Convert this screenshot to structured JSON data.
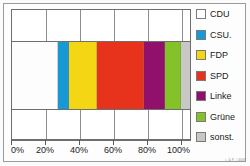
{
  "chart_data": {
    "type": "bar",
    "orientation": "horizontal-stacked",
    "title": "",
    "xlabel": "",
    "ylabel": "",
    "xlim": [
      0,
      100
    ],
    "grid": true,
    "legend_position": "right",
    "categories": [
      ""
    ],
    "tick_labels": [
      "0%",
      "20%",
      "40%",
      "60%",
      "80%",
      "100%"
    ],
    "tick_values": [
      0,
      20,
      40,
      60,
      80,
      100
    ],
    "series": [
      {
        "name": "CDU",
        "color": "#fdfdfd",
        "values": [
          26
        ]
      },
      {
        "name": "CSU.",
        "color": "#1799d6",
        "values": [
          6
        ]
      },
      {
        "name": "FDP",
        "color": "#f5d614",
        "values": [
          16
        ]
      },
      {
        "name": "SPD",
        "color": "#e8331c",
        "values": [
          26
        ]
      },
      {
        "name": "Linke",
        "color": "#90106b",
        "values": [
          12
        ]
      },
      {
        "name": "Grüne",
        "color": "#84c22a",
        "values": [
          9
        ]
      },
      {
        "name": "sonst.",
        "color": "#c8c8c4",
        "values": [
          5
        ]
      }
    ]
  },
  "legend": {
    "items": [
      {
        "label": "CDU",
        "color": "#fdfdfd"
      },
      {
        "label": "CSU.",
        "color": "#1799d6"
      },
      {
        "label": "FDP",
        "color": "#f5d614"
      },
      {
        "label": "SPD",
        "color": "#e8331c"
      },
      {
        "label": "Linke",
        "color": "#90106b"
      },
      {
        "label": "Grüne",
        "color": "#84c22a"
      },
      {
        "label": "sonst.",
        "color": "#c8c8c4"
      }
    ]
  },
  "axis": {
    "labels": [
      "0%",
      "20%",
      "40%",
      "60%",
      "80%",
      "100%"
    ]
  },
  "credit": {
    "text": "i. & P. / 4008"
  }
}
